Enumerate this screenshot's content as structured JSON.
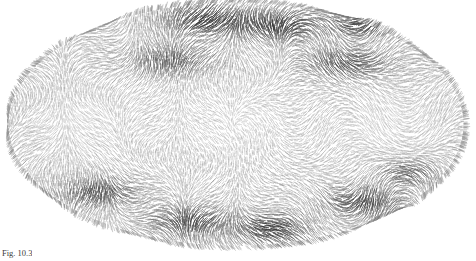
{
  "figure": {
    "kind": "elliptical-projection-vector-field",
    "caption": "Fig. 10.3",
    "background_color": "#ffffff",
    "stroke_color": "#4a4a4a",
    "dark_blob_color": "#2b2b2b",
    "light_tone_color": "#b9b9b9"
  },
  "chart_data": {
    "type": "scatter",
    "title": "",
    "subtitle": "",
    "xlabel": "",
    "ylabel": "",
    "grid": false,
    "legend": "none",
    "projection": "mollweide-ellipse",
    "ellipse": {
      "cx": 236,
      "cy": 124,
      "rx": 228,
      "ry": 122
    },
    "xlim": [
      -180,
      180
    ],
    "ylim": [
      -90,
      90
    ],
    "stroke_count": 17000,
    "field": {
      "mode": "multipole",
      "base_angle_deg": 0,
      "lobes_longitude": 4,
      "lobes_latitude": 3,
      "swirl": 1.15,
      "amplitude": 1.0
    },
    "dark_blobs": [
      {
        "name": "north-center-left",
        "x_frac": 0.44,
        "y_frac": 0.07,
        "rx": 46,
        "ry": 17,
        "strength": 0.95
      },
      {
        "name": "north-center-right",
        "x_frac": 0.6,
        "y_frac": 0.1,
        "rx": 40,
        "ry": 16,
        "strength": 0.85
      },
      {
        "name": "north-right-outer",
        "x_frac": 0.78,
        "y_frac": 0.09,
        "rx": 34,
        "ry": 14,
        "strength": 0.8
      },
      {
        "name": "north-left-inner",
        "x_frac": 0.36,
        "y_frac": 0.24,
        "rx": 44,
        "ry": 16,
        "strength": 0.7
      },
      {
        "name": "north-right-inner",
        "x_frac": 0.74,
        "y_frac": 0.25,
        "rx": 44,
        "ry": 16,
        "strength": 0.75
      },
      {
        "name": "south-left-outer",
        "x_frac": 0.2,
        "y_frac": 0.78,
        "rx": 38,
        "ry": 15,
        "strength": 0.78
      },
      {
        "name": "south-center-left",
        "x_frac": 0.4,
        "y_frac": 0.9,
        "rx": 40,
        "ry": 16,
        "strength": 0.82
      },
      {
        "name": "south-center-right",
        "x_frac": 0.58,
        "y_frac": 0.93,
        "rx": 38,
        "ry": 15,
        "strength": 0.88
      },
      {
        "name": "south-right-outer",
        "x_frac": 0.78,
        "y_frac": 0.82,
        "rx": 40,
        "ry": 16,
        "strength": 0.8
      },
      {
        "name": "south-right-far",
        "x_frac": 0.88,
        "y_frac": 0.7,
        "rx": 30,
        "ry": 14,
        "strength": 0.6
      }
    ],
    "light_patches": [
      {
        "name": "west-mid",
        "x_frac": 0.16,
        "y_frac": 0.5,
        "rx": 52,
        "ry": 34,
        "strength": 0.55
      },
      {
        "name": "center",
        "x_frac": 0.5,
        "y_frac": 0.5,
        "rx": 66,
        "ry": 40,
        "strength": 0.4
      },
      {
        "name": "east-mid",
        "x_frac": 0.84,
        "y_frac": 0.5,
        "rx": 52,
        "ry": 34,
        "strength": 0.55
      },
      {
        "name": "north-pole",
        "x_frac": 0.5,
        "y_frac": 0.02,
        "rx": 40,
        "ry": 12,
        "strength": 0.45
      }
    ],
    "values": [],
    "x": []
  }
}
